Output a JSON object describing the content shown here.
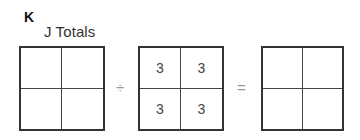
{
  "problem": {
    "letter": "K",
    "title": "J Totals"
  },
  "operators": {
    "divide": "÷",
    "equals": "="
  },
  "grids": {
    "left": {
      "cells": [
        "",
        "",
        "",
        ""
      ]
    },
    "middle": {
      "cells": [
        "3",
        "3",
        "3",
        "3"
      ]
    },
    "right": {
      "cells": [
        "",
        "",
        "",
        ""
      ]
    }
  }
}
